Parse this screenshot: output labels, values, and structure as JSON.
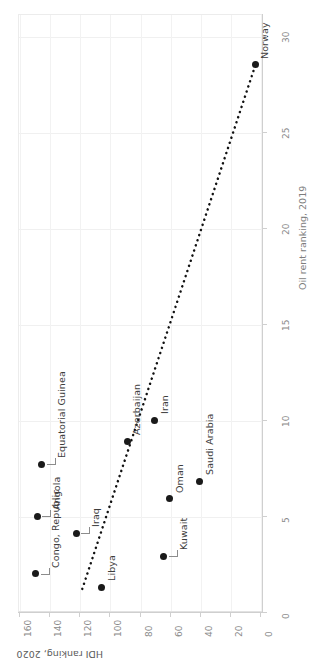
{
  "chart_data": {
    "type": "scatter",
    "title": "",
    "subtitle": "",
    "xlabel": "Oil rent ranking, 2019",
    "ylabel": "HDI ranking, 2020",
    "orientation": "rotated-90",
    "grid": true,
    "legend": "none",
    "xlim": [
      0,
      31
    ],
    "ylim": [
      0,
      170
    ],
    "xticks": [
      0,
      5,
      10,
      15,
      20,
      25,
      30
    ],
    "xtick_labels": [
      "0",
      "5",
      "10",
      "15",
      "20",
      "25",
      "30"
    ],
    "yticks": [
      0,
      20,
      40,
      60,
      80,
      100,
      120,
      140,
      160
    ],
    "ytick_labels": [
      "0",
      "20",
      "40",
      "60",
      "80",
      "100",
      "120",
      "140",
      "160"
    ],
    "point_color": "#1a1a1a",
    "trendline": {
      "style": "dotted",
      "color": "#111111",
      "x_start": 1.2,
      "y_start": 118,
      "x_end": 28.5,
      "y_end": 3
    },
    "points": [
      {
        "label": "Norway",
        "x": 28.5,
        "y": 3,
        "label_side": "after"
      },
      {
        "label": "Iran",
        "x": 10,
        "y": 70,
        "label_side": "after"
      },
      {
        "label": "Azerbaijan",
        "x": 8.9,
        "y": 88,
        "label_side": "after"
      },
      {
        "label": "Saudi Arabia",
        "x": 6.8,
        "y": 40,
        "label_side": "after"
      },
      {
        "label": "Oman",
        "x": 5.9,
        "y": 60,
        "label_side": "after"
      },
      {
        "label": "Equatorial Guinea",
        "x": 7.7,
        "y": 145,
        "label_side": "leader"
      },
      {
        "label": "Angola",
        "x": 5.0,
        "y": 148,
        "label_side": "leader"
      },
      {
        "label": "Iraq",
        "x": 4.1,
        "y": 122,
        "label_side": "leader"
      },
      {
        "label": "Kuwait",
        "x": 2.9,
        "y": 64,
        "label_side": "leader"
      },
      {
        "label": "Congo, Republic",
        "x": 2.0,
        "y": 149,
        "label_side": "leader"
      },
      {
        "label": "Libya",
        "x": 1.3,
        "y": 105,
        "label_side": "after"
      }
    ]
  },
  "axes": {
    "x_title": "Oil rent ranking, 2019",
    "y_title": "HDI ranking, 2020"
  }
}
